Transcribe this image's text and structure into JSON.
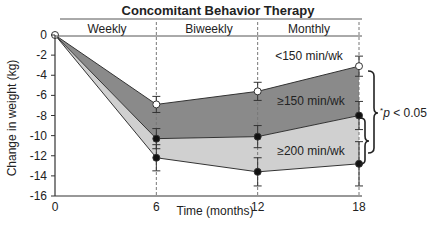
{
  "chart_data": {
    "type": "area",
    "title": "Concomitant Behavior Therapy",
    "phases": [
      {
        "label": "Weekly",
        "from": 0,
        "to": 6
      },
      {
        "label": "Biweekly",
        "from": 6,
        "to": 12
      },
      {
        "label": "Monthly",
        "from": 12,
        "to": 18
      }
    ],
    "xlabel": "Time (months)",
    "ylabel": "Change in weight (kg)",
    "x": [
      0,
      6,
      12,
      18
    ],
    "x_ticks": [
      "0",
      "6",
      "12",
      "18"
    ],
    "y_ticks": [
      "0",
      "-2",
      "-4",
      "-6",
      "-8",
      "-10",
      "-12",
      "-14",
      "-16"
    ],
    "ylim": [
      -16,
      0
    ],
    "xlim": [
      0,
      18
    ],
    "grid": false,
    "series": [
      {
        "name": "<150 min/wk",
        "values": [
          0,
          -6.9,
          -5.6,
          -3.1
        ],
        "marker": "open-circle",
        "error": [
          0,
          0.8,
          0.9,
          1.0
        ]
      },
      {
        "name": "≥150 min/wk",
        "values": [
          0,
          -10.3,
          -10.1,
          -8.0
        ],
        "marker": "filled-circle",
        "error": [
          0,
          1.0,
          1.1,
          1.4
        ]
      },
      {
        "name": "≥200 min/wk",
        "values": [
          0,
          -12.2,
          -13.6,
          -12.8
        ],
        "marker": "filled-circle",
        "error": [
          0,
          1.3,
          1.4,
          2.2
        ]
      }
    ],
    "annotations": [
      {
        "text": "*p < 0.05",
        "note": "brackets comparing <150 vs ≥150 and ≥150 vs ≥200 at 18 months"
      }
    ],
    "fills": {
      "upper_band": "#8a8a8a",
      "lower_band": "#d0d0d0"
    }
  },
  "labels": {
    "title": "Concomitant Behavior Therapy",
    "phase_weekly": "Weekly",
    "phase_biweekly": "Biweekly",
    "phase_monthly": "Monthly",
    "series_low": "<150 min/wk",
    "series_mid": "≥150 min/wk",
    "series_high": "≥200 min/wk",
    "pvalue_star": "*",
    "pvalue_p": "p",
    "pvalue_rest": " < 0.05",
    "xlabel": "Time (months)",
    "ylabel": "Change in weight (kg)"
  }
}
